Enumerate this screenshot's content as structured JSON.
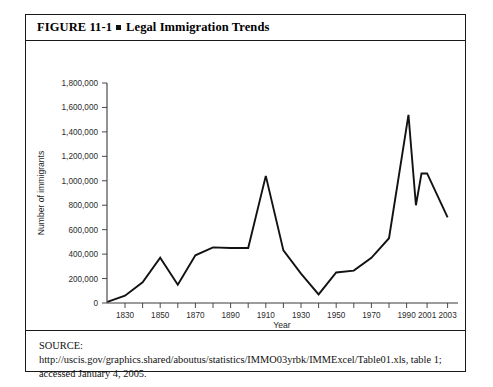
{
  "figure": {
    "number": "FIGURE 11-1",
    "bullet": "square-bullet",
    "title": "Legal Immigration Trends",
    "source": "SOURCE:  http://uscis.gov/graphics.shared/aboutus/statistics/IMMO03yrbk/IMMExcel/Table01.xls, table 1; accessed January 4, 2005."
  },
  "chart_data": {
    "type": "line",
    "title": "Legal Immigration Trends",
    "xlabel": "Year",
    "ylabel": "Number of immigrants",
    "ylim": [
      0,
      1800000
    ],
    "ytick_labels": [
      "0",
      "200,000",
      "400,000",
      "600,000",
      "800,000",
      "1,000,000",
      "1,200,000",
      "1,400,000",
      "1,600,000",
      "1,800,000"
    ],
    "ytick_values": [
      0,
      200000,
      400000,
      600000,
      800000,
      1000000,
      1200000,
      1400000,
      1600000,
      1800000
    ],
    "xtick_labels": [
      "1830",
      "",
      "1850",
      "",
      "1870",
      "",
      "1890",
      "",
      "1910",
      "",
      "1930",
      "",
      "1950",
      "",
      "1970",
      "",
      "1990",
      "2001",
      "2003"
    ],
    "grid": false,
    "legend": "none",
    "x": [
      1820,
      1830,
      1840,
      1850,
      1860,
      1870,
      1880,
      1890,
      1900,
      1910,
      1920,
      1930,
      1940,
      1950,
      1960,
      1970,
      1980,
      1991,
      1995,
      1998,
      2001,
      2003
    ],
    "values": [
      10000,
      60000,
      170000,
      370000,
      150000,
      390000,
      455000,
      450000,
      450000,
      1040000,
      430000,
      240000,
      70000,
      250000,
      265000,
      370000,
      530000,
      1540000,
      800000,
      1060000,
      1060000,
      700000
    ],
    "annotations": {
      "peak_1910": 1040000,
      "peak_1991": 1540000,
      "trough_1940": 70000
    }
  }
}
